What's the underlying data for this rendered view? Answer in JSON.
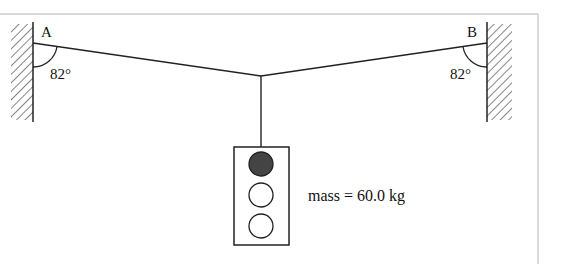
{
  "diagram": {
    "point_a": {
      "label": "A"
    },
    "point_b": {
      "label": "B"
    },
    "angle_a": {
      "label": "82°"
    },
    "angle_b": {
      "label": "82°"
    },
    "mass_label": "mass = 60.0 kg",
    "traffic_light": {
      "lights": [
        "filled",
        "empty",
        "empty"
      ],
      "filled_color": "#444444"
    },
    "frame_border_color": "#d0d0d0"
  }
}
